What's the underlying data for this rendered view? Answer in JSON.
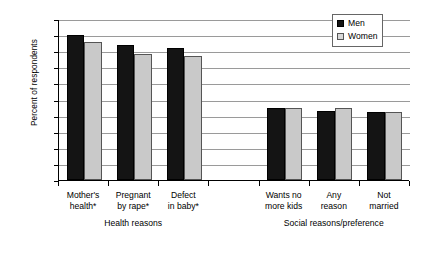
{
  "chart_data": {
    "type": "bar",
    "title": "",
    "xlabel": "",
    "ylabel": "Percent of respondents",
    "ylim": [
      0,
      100
    ],
    "ytick_step": 10,
    "yticks": [
      0,
      10,
      20,
      30,
      40,
      50,
      60,
      70,
      80,
      90,
      100
    ],
    "grid": true,
    "legend_position": "top-right",
    "categories": [
      "Mother's\nhealth*",
      "Pregnant\nby rape*",
      "Defect\nin baby*",
      "Wants no\nmore kids",
      "Any\nreason",
      "Not\nmarried"
    ],
    "category_groups": [
      {
        "label": "Health reasons",
        "categories": [
          0,
          1,
          2
        ]
      },
      {
        "label": "Social reasons/preference",
        "categories": [
          3,
          4,
          5
        ]
      }
    ],
    "series": [
      {
        "name": "Men",
        "color": "#141414",
        "values": [
          90,
          84,
          82,
          45,
          43,
          42
        ]
      },
      {
        "name": "Women",
        "color": "#c9c9c9",
        "values": [
          86,
          78,
          77,
          45,
          45,
          42
        ]
      }
    ]
  },
  "legend": {
    "items": [
      {
        "label": "Men"
      },
      {
        "label": "Women"
      }
    ]
  },
  "axis": {
    "y_title": "Percent of respondents",
    "tick_labels": [
      "100",
      "90",
      "80",
      "70",
      "60",
      "50",
      "40",
      "30",
      "20",
      "10",
      "0"
    ]
  },
  "categories_display": [
    "Mother's\nhealth*",
    "Pregnant\nby rape*",
    "Defect\nin baby*",
    "Wants no\nmore kids",
    "Any\nreason",
    "Not\nmarried"
  ],
  "group_labels": [
    "Health reasons",
    "Social reasons/preference"
  ]
}
